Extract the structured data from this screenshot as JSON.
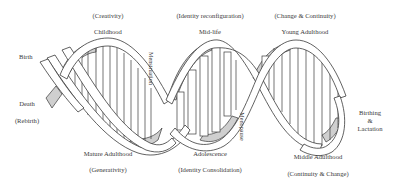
{
  "diagram": {
    "type": "double-helix life-stage diagram",
    "colors": {
      "strand_fill": "#ffffff",
      "strand_stroke": "#3a3a3a",
      "shade": "#cfcfcf",
      "rung_stroke": "#3a3a3a"
    }
  },
  "labels": {
    "top": [
      {
        "stage": "Childhood",
        "quality": "(Creativity)"
      },
      {
        "stage": "Mid-life",
        "quality": "(Identity reconfiguration)"
      },
      {
        "stage": "Young Adulthood",
        "quality": "(Change & Continuity)"
      }
    ],
    "bottom": [
      {
        "stage": "Mature Adulthood",
        "quality": "(Generativity)"
      },
      {
        "stage": "Adolescence",
        "quality": "(Identity Consolidation)"
      },
      {
        "stage": "Middle Adulthood",
        "quality": "(Continuity & Change)"
      }
    ],
    "left": {
      "birth": "Birth",
      "death": "Death",
      "rebirth": "(Rebirth)"
    },
    "right": {
      "line1": "Birthing",
      "line2": "&",
      "line3": "Lactation"
    },
    "vertical": {
      "menstruation": "Menstruation",
      "menopause": "Menopause"
    }
  }
}
